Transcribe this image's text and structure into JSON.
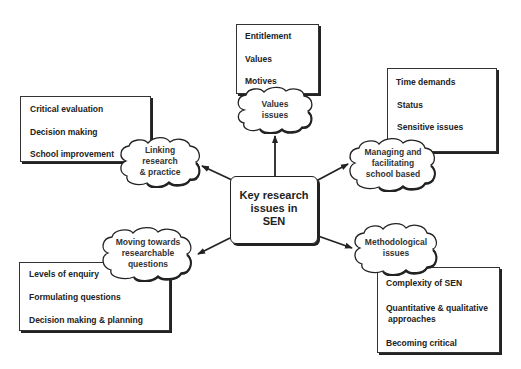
{
  "center": {
    "line1": "Key research",
    "line2": "issues in",
    "line3": "SEN"
  },
  "nodes": {
    "values": {
      "cloud": [
        "Values",
        "issues"
      ],
      "items": [
        "Entitlement",
        "Values",
        "Motives"
      ]
    },
    "managing": {
      "cloud": [
        "Managing and",
        "facilitating",
        "school based"
      ],
      "items": [
        "Time demands",
        "Status",
        "Sensitive issues"
      ]
    },
    "linking": {
      "cloud": [
        "Linking",
        "research",
        "& practice"
      ],
      "items": [
        "Critical evaluation",
        "Decision making",
        "School improvement"
      ]
    },
    "moving": {
      "cloud": [
        "Moving towards",
        "researchable",
        "questions"
      ],
      "items": [
        "Levels of enquiry",
        "Formulating questions",
        "Decision making & planning"
      ]
    },
    "methodological": {
      "cloud": [
        "Methodological",
        "issues"
      ],
      "items": [
        "Complexity of SEN",
        "Quantitative & qualitative",
        "approaches",
        "Becoming critical"
      ]
    }
  },
  "colors": {
    "stroke": "#222222",
    "background": "#ffffff"
  }
}
